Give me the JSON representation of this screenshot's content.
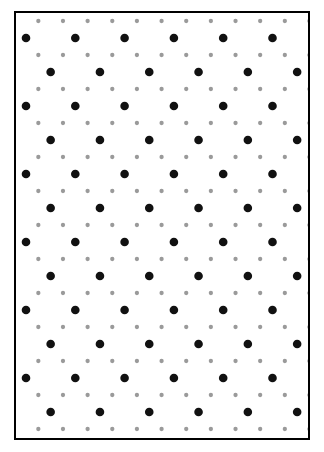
{
  "figure": {
    "kind": "dot-lattice-diagram",
    "caption": "",
    "panel": {
      "x": 14,
      "y": 11,
      "width": 296,
      "height": 429,
      "border_color": "#000000",
      "border_width": 2,
      "background": "#ffffff"
    },
    "caption_box": {
      "x": 14,
      "y": 444,
      "width": 300,
      "height": 8
    }
  },
  "chart_data": {
    "type": "scatter",
    "title": "",
    "subtitle": "",
    "xlabel": "",
    "ylabel": "",
    "xlim": [
      0,
      296
    ],
    "ylim": [
      0,
      429
    ],
    "grid": false,
    "legend": null,
    "axis_ticks": false,
    "lattice": {
      "description": "Centered rectangular lattice of large black dots with a finer interstitial lattice of small gray dots",
      "horizontal_period": 49.3,
      "vertical_period": 34.0,
      "row_offset_fraction": 0.5,
      "origin_x": 10.0,
      "origin_y": 25.0
    },
    "series": [
      {
        "name": "major-sites",
        "marker": "circle",
        "color": "#111111",
        "radius": 4.3,
        "count": 78,
        "lattice_role": "black large dots"
      },
      {
        "name": "minor-sites",
        "marker": "circle",
        "color": "#9a9a9a",
        "radius": 2.15,
        "count": 156,
        "lattice_role": "gray small dots at quarter offsets"
      }
    ]
  },
  "colors": {
    "major_dot": "#111111",
    "minor_dot": "#9a9a9a",
    "frame": "#000000",
    "paper": "#ffffff"
  }
}
